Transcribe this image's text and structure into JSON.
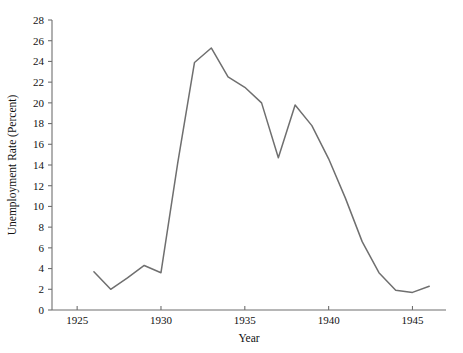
{
  "chart_data": {
    "type": "line",
    "title": "",
    "xlabel": "Year",
    "ylabel": "Unemployment Rate (Percent)",
    "xlim": [
      1923.5,
      1947.0
    ],
    "ylim": [
      0,
      28
    ],
    "grid": false,
    "legend": null,
    "line_color": "#6f6f6f",
    "x_ticks": [
      1925,
      1930,
      1935,
      1940,
      1945
    ],
    "x_tick_labels": [
      "1925",
      "1930",
      "1935",
      "1940",
      "1945"
    ],
    "y_ticks": [
      0,
      2,
      4,
      6,
      8,
      10,
      12,
      14,
      16,
      18,
      20,
      22,
      24,
      26,
      28
    ],
    "y_tick_labels": [
      "0",
      "2",
      "4",
      "6",
      "8",
      "10",
      "12",
      "14",
      "16",
      "18",
      "20",
      "22",
      "24",
      "26",
      "28"
    ],
    "x": [
      1926,
      1927,
      1928,
      1929,
      1930,
      1931,
      1932,
      1933,
      1934,
      1935,
      1936,
      1937,
      1938,
      1939,
      1940,
      1941,
      1942,
      1943,
      1944,
      1945,
      1946
    ],
    "values": [
      3.7,
      2.0,
      3.1,
      4.3,
      3.6,
      14.2,
      23.9,
      25.3,
      22.5,
      21.5,
      20.0,
      14.7,
      19.8,
      17.8,
      14.6,
      10.8,
      6.6,
      3.6,
      1.9,
      1.7,
      2.3
    ],
    "series": [
      {
        "name": "Unemployment Rate",
        "values": [
          3.7,
          2.0,
          3.1,
          4.3,
          3.6,
          14.2,
          23.9,
          25.3,
          22.5,
          21.5,
          20.0,
          14.7,
          19.8,
          17.8,
          14.6,
          10.8,
          6.6,
          3.6,
          1.9,
          1.7,
          2.3
        ]
      }
    ]
  },
  "layout": {
    "plot_left": 52,
    "plot_right": 446,
    "plot_top": 20,
    "plot_bottom": 310,
    "x_axis_start": 1923.5,
    "x_axis_end": 1947.0,
    "y_axis_min": 0,
    "y_axis_max": 28,
    "tick_length": 4
  }
}
